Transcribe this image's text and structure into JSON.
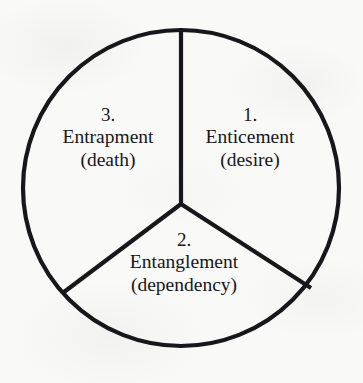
{
  "figure": {
    "type": "pie-wheel-diagram",
    "shape": "circle-divided-in-three-equal-wedges",
    "background_color": "#f9f9f8",
    "ink_color": "#17161a",
    "circle": {
      "center_x": 181,
      "center_y": 188,
      "radius": 158,
      "stroke_width": 4
    },
    "hub": {
      "x": 181,
      "y": 204
    },
    "spoke_angles_degrees": [
      90,
      210,
      330
    ]
  },
  "wedges": [
    {
      "id": "enticement",
      "position": "right",
      "number": "1.",
      "name": "Enticement",
      "qualifier": "(desire)"
    },
    {
      "id": "entanglement",
      "position": "bottom",
      "number": "2.",
      "name": "Entanglement",
      "qualifier": "(dependency)"
    },
    {
      "id": "entrapment",
      "position": "left",
      "number": "3.",
      "name": "Entrapment",
      "qualifier": "(death)"
    }
  ]
}
